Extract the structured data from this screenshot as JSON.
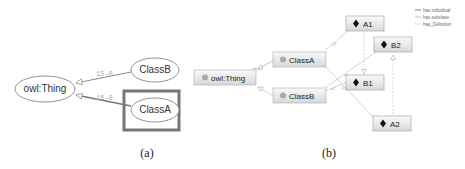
{
  "panel_a": {
    "caption": "(a)",
    "nodes": {
      "root": "owl:Thing",
      "class_b": "ClassB",
      "class_a": "ClassA"
    },
    "edges": {
      "b_to_root": "15-0",
      "a_to_root": "16-0"
    },
    "selected_node": "ClassA"
  },
  "panel_b": {
    "caption": "(b)",
    "class_nodes": {
      "root": "owl:Thing",
      "class_a": "ClassA",
      "class_b": "ClassB"
    },
    "individual_nodes": {
      "a1": "A1",
      "b2": "B2",
      "b1": "B1",
      "a2": "A2"
    },
    "legend": {
      "has_individual": "has individual",
      "has_subclass": "has subclass",
      "has_definition": "has_Definition"
    }
  }
}
